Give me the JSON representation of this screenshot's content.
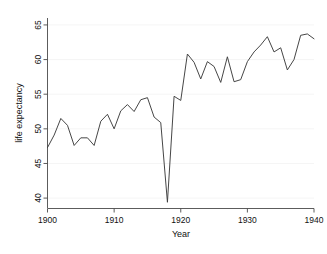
{
  "chart_data": {
    "type": "line",
    "title": "",
    "xlabel": "Year",
    "ylabel": "life expectancy",
    "xlim": [
      1900,
      1940
    ],
    "ylim": [
      38.5,
      66
    ],
    "grid": true,
    "legend": "none",
    "x_ticks": [
      1900,
      1910,
      1920,
      1930,
      1940
    ],
    "x_tick_labels": [
      "1900",
      "1910",
      "1920",
      "1930",
      "1940"
    ],
    "y_ticks": [
      40,
      45,
      50,
      55,
      60,
      65
    ],
    "y_tick_labels": [
      "40",
      "45",
      "50",
      "55",
      "60",
      "65"
    ],
    "series": [
      {
        "name": "life expectancy",
        "color": "#3c3c3c",
        "x": [
          1900,
          1901,
          1902,
          1903,
          1904,
          1905,
          1906,
          1907,
          1908,
          1909,
          1910,
          1911,
          1912,
          1913,
          1914,
          1915,
          1916,
          1917,
          1918,
          1919,
          1920,
          1921,
          1922,
          1923,
          1924,
          1925,
          1926,
          1927,
          1928,
          1929,
          1930,
          1931,
          1932,
          1933,
          1934,
          1935,
          1936,
          1937,
          1938,
          1939,
          1940
        ],
        "values": [
          47.3,
          49.1,
          51.5,
          50.5,
          47.6,
          48.7,
          48.7,
          47.6,
          51.1,
          52.1,
          50.0,
          52.6,
          53.5,
          52.5,
          54.2,
          54.5,
          51.7,
          50.9,
          39.4,
          54.7,
          54.1,
          60.8,
          59.6,
          57.2,
          59.7,
          59.0,
          56.7,
          60.4,
          56.8,
          57.1,
          59.7,
          61.1,
          62.1,
          63.3,
          61.1,
          61.7,
          58.5,
          60.0,
          63.5,
          63.7,
          63.0
        ]
      }
    ],
    "annotations": [
      {
        "label": "1918 influenza pandemic trough",
        "x": 1918,
        "y": 39.4
      }
    ]
  },
  "axes": {
    "x_axis_title": "Year",
    "y_axis_title": "life expectancy"
  }
}
